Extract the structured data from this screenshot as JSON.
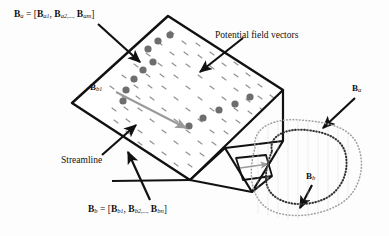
{
  "figure": {
    "type": "diagram",
    "labels": {
      "ba_formula": "B_a = [B_a1, B_a2,..., B_am]",
      "bb_formula": "B_b = [B_b1, B_b2,..., B_bn]",
      "potential_field_vectors": "Potential field vectors",
      "streamline": "Streamline",
      "bb1": "B_b1",
      "ba_right": "B_a",
      "bb_right": "B_b"
    },
    "formula_parts": {
      "ba": {
        "lhs": "B",
        "lhs_sub": "a",
        "terms": [
          "B",
          "a1",
          "B",
          "a2",
          "B",
          "am"
        ]
      },
      "bb": {
        "lhs": "B",
        "lhs_sub": "b",
        "terms": [
          "B",
          "b1",
          "B",
          "b2",
          "B",
          "bn"
        ]
      }
    },
    "colors": {
      "outline": "#111111",
      "field_vector": "#8a8a8a",
      "sample_dot": "#707070",
      "streamline_arrow": "#9a9a9a",
      "contour_dotted": "#4a4a4a",
      "contour_outer": "#9a9a9a",
      "background": "#ffffff"
    },
    "geometry": {
      "plane_corners": [
        [
          72,
          103
        ],
        [
          168,
          16
        ],
        [
          283,
          90
        ],
        [
          190,
          180
        ]
      ],
      "fold_corners": [
        [
          283,
          90
        ],
        [
          283,
          140
        ],
        [
          252,
          192
        ],
        [
          190,
          180
        ]
      ],
      "right_corner": [
        283,
        90
      ],
      "top_corner": [
        168,
        16
      ],
      "left_corner": [
        72,
        103
      ],
      "bottom_corner": [
        190,
        180
      ]
    },
    "sample_dots": [
      [
        123,
        101
      ],
      [
        126,
        90
      ],
      [
        134,
        79
      ],
      [
        143,
        70
      ],
      [
        153,
        62
      ],
      [
        148,
        49
      ],
      [
        158,
        41
      ],
      [
        170,
        35
      ],
      [
        189,
        126
      ],
      [
        203,
        118
      ],
      [
        219,
        110
      ],
      [
        235,
        104
      ],
      [
        250,
        97
      ]
    ],
    "counts": {
      "field_vector_rows": 9,
      "field_vector_cols": 10,
      "sample_dots": 13
    }
  }
}
